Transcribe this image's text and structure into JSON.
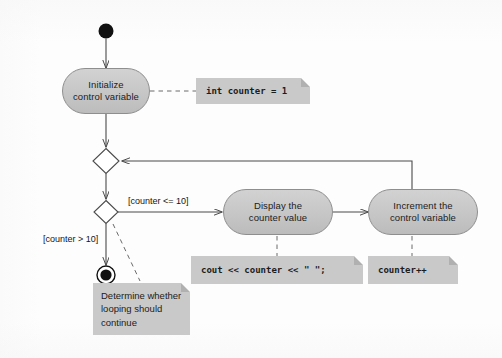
{
  "diagram": {
    "type": "uml-activity-diagram",
    "nodes": {
      "initial": {
        "kind": "initial-node",
        "label": ""
      },
      "initialize": {
        "kind": "action",
        "line1": "Initialize",
        "line2": "control variable"
      },
      "merge": {
        "kind": "merge-node",
        "label": ""
      },
      "decision": {
        "kind": "decision-node",
        "label": ""
      },
      "display": {
        "kind": "action",
        "line1": "Display the",
        "line2": "counter value"
      },
      "increment": {
        "kind": "action",
        "line1": "Increment the",
        "line2": "control variable"
      },
      "final": {
        "kind": "final-node",
        "label": ""
      }
    },
    "guards": {
      "loop_continue": "[counter <= 10]",
      "loop_exit": "[counter > 10]"
    },
    "notes": {
      "init_code": "int counter = 1",
      "display_code": "cout << counter << \" \";",
      "increment_code": "counter++",
      "decision_note_line1": "Determine whether",
      "decision_note_line2": "looping should",
      "decision_note_line3": "continue"
    },
    "colors": {
      "node_fill": "#c6c6c6",
      "node_stroke": "#8e8e8e",
      "note_fill": "#c9c9c9",
      "line": "#4a4a4a",
      "text": "#1c1c1c",
      "background": "#fdfdfd"
    }
  }
}
